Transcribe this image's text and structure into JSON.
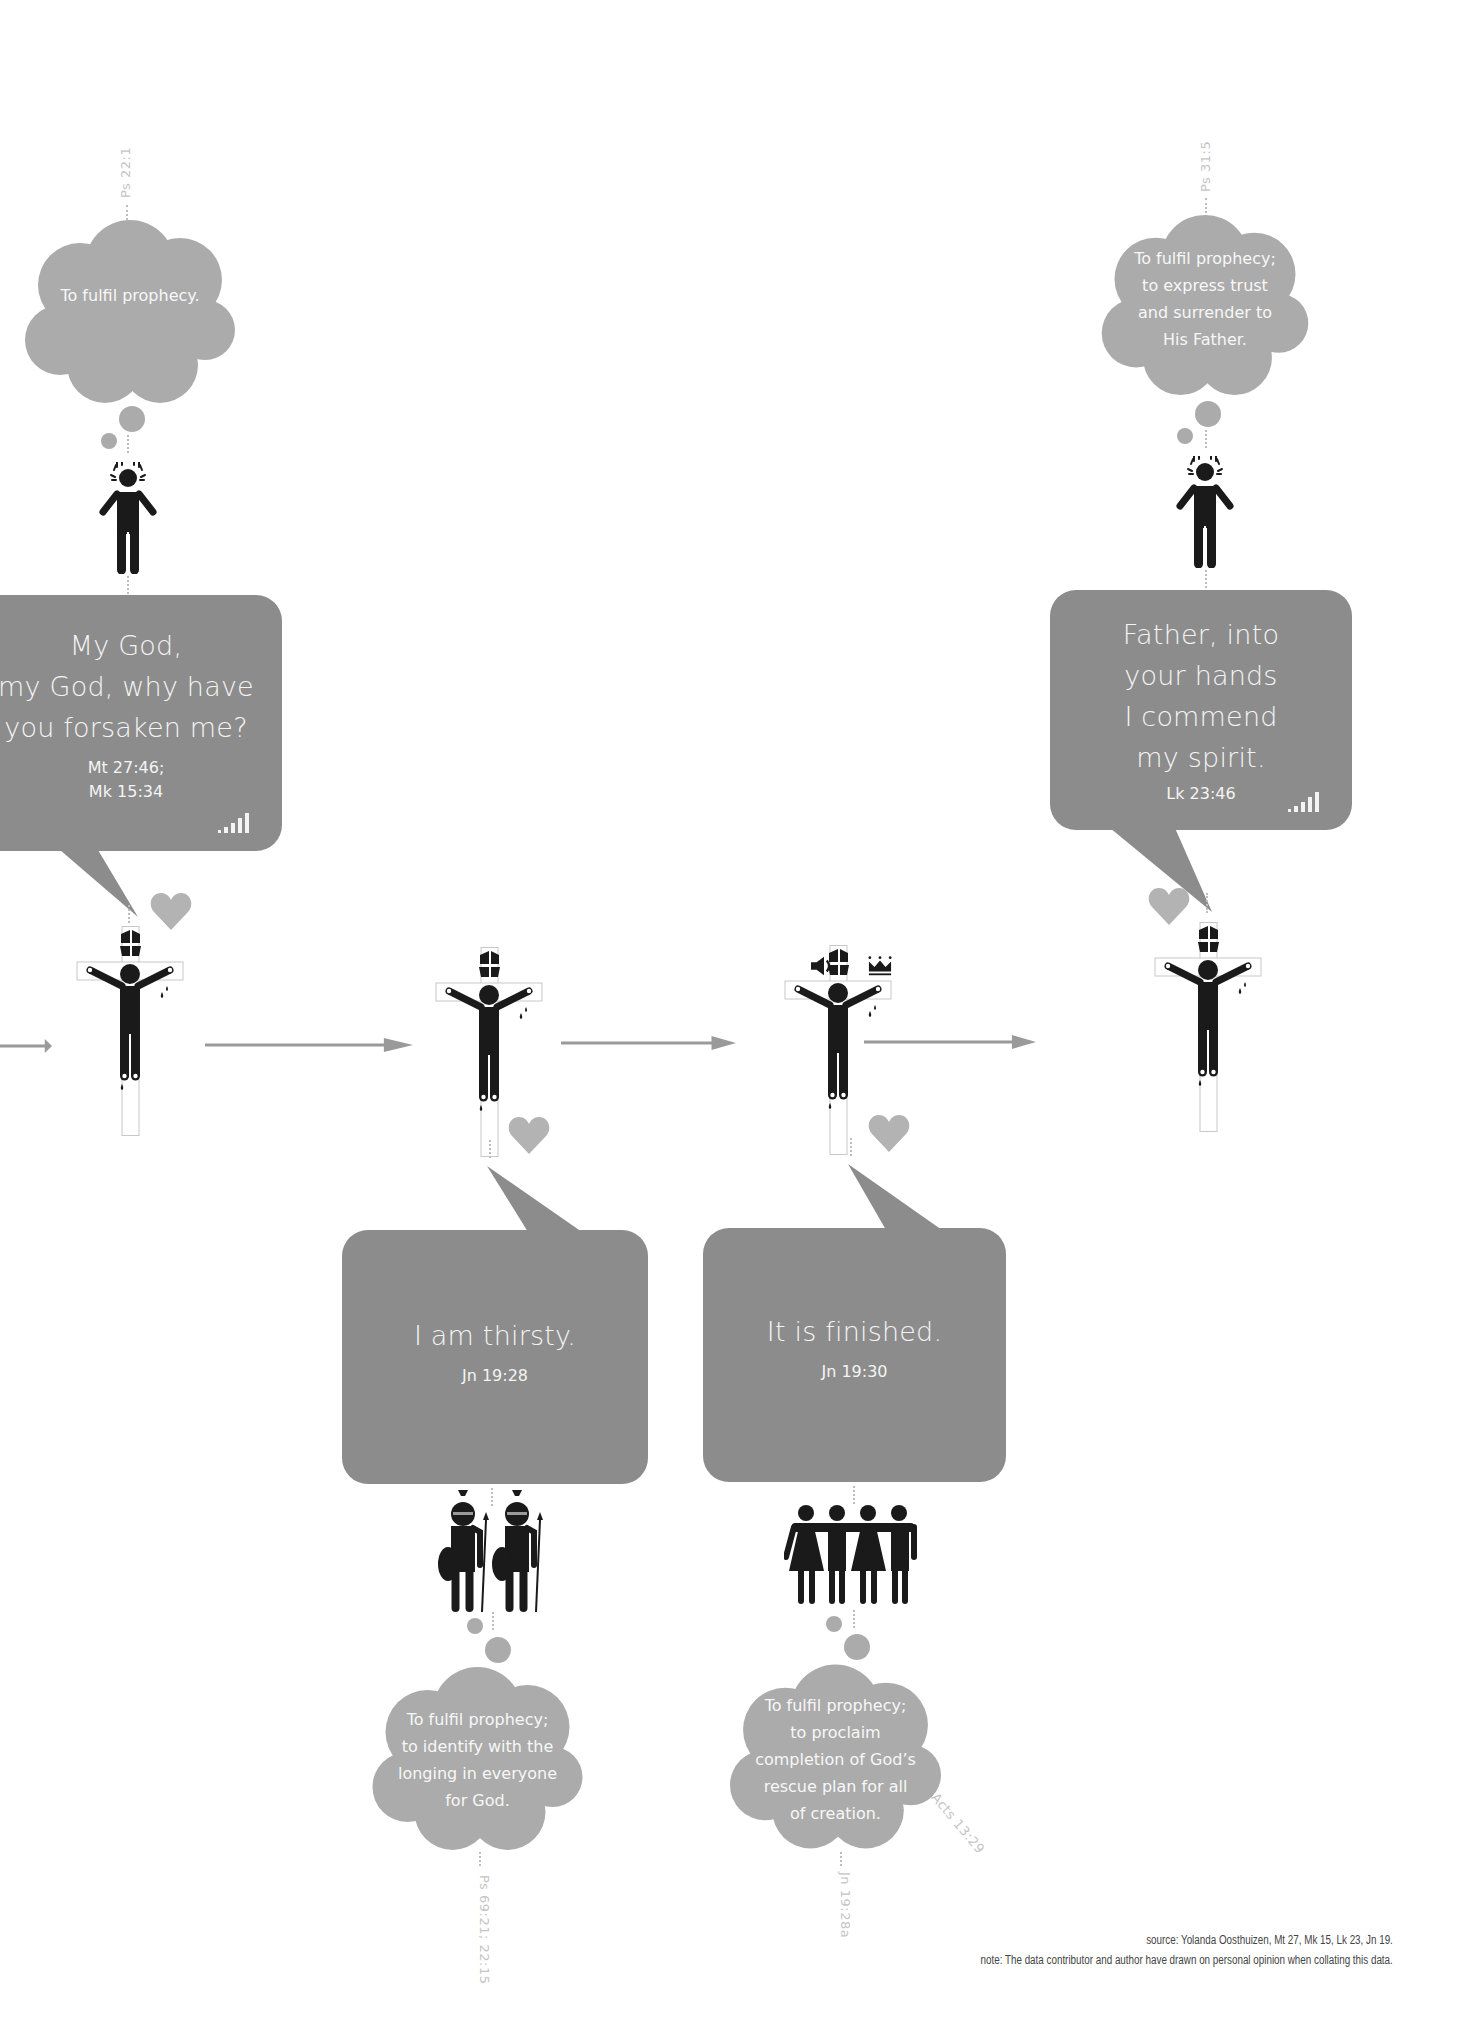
{
  "colors": {
    "bubble": "#8c8c8c",
    "cloud": "#ababab",
    "heart": "#b3b3b3",
    "arrow": "#9a9a9a",
    "figure": "#1a1a1a",
    "ref_text": "#c4c4c4"
  },
  "sayings": [
    {
      "quote_lines": [
        "My God,",
        "my God, why have",
        "you forsaken me?"
      ],
      "ref_lines": [
        "Mt 27:46;",
        "Mk 15:34"
      ],
      "thought": [
        "To fulfil prophecy."
      ],
      "prophecy_ref": "Ps 22:1",
      "observer": "distressed-person",
      "signal_icon": "signal-strength-icon"
    },
    {
      "quote_lines": [
        "I am thirsty."
      ],
      "ref_lines": [
        "Jn 19:28"
      ],
      "thought": [
        "To fulfil prophecy;",
        "to identify with the",
        "longing in everyone",
        "for God."
      ],
      "prophecy_ref": "Ps 69:21; 22:15",
      "observer": "roman-soldiers"
    },
    {
      "quote_lines": [
        "It is finished."
      ],
      "ref_lines": [
        "Jn 19:30"
      ],
      "thought": [
        "To fulfil prophecy;",
        "to proclaim",
        "completion of God’s",
        "rescue plan for all",
        "of creation."
      ],
      "prophecy_ref": "Jn 19:28a",
      "prophecy_ref_2": "Acts 13:29",
      "observer": "crowd-of-people",
      "cross_extra_icons": [
        "speaker-icon",
        "crown-icon"
      ]
    },
    {
      "quote_lines": [
        "Father, into",
        "your hands",
        "I commend",
        "my spirit."
      ],
      "ref_lines": [
        "Lk 23:46"
      ],
      "thought": [
        "To fulfil prophecy;",
        "to express trust",
        "and surrender to",
        "His Father."
      ],
      "prophecy_ref": "Ps 31:5",
      "observer": "distressed-person",
      "signal_icon": "signal-strength-icon"
    }
  ],
  "footer": {
    "source": "source: Yolanda Oosthuizen, Mt 27, Mk 15, Lk 23, Jn 19.",
    "note": "note: The data contributor and author have drawn on personal opinion when collating this data."
  }
}
